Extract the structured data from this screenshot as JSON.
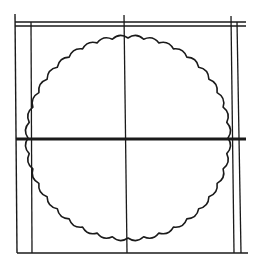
{
  "figure": {
    "width": 262,
    "height": 266,
    "background": "#ffffff",
    "stroke_color": "#1a1a1a",
    "lines": [
      {
        "id": "top-line-outer",
        "x1": 15,
        "y1": 22,
        "x2": 246,
        "y2": 22,
        "w": 1.4
      },
      {
        "id": "top-line-inner",
        "x1": 15,
        "y1": 26,
        "x2": 246,
        "y2": 26,
        "w": 1.4
      },
      {
        "id": "middle-line",
        "x1": 16,
        "y1": 139,
        "x2": 246,
        "y2": 139,
        "w": 2.8
      },
      {
        "id": "bottom-line",
        "x1": 17,
        "y1": 253,
        "x2": 248,
        "y2": 253,
        "w": 1.4
      },
      {
        "id": "left-outer-line",
        "x1": 15,
        "y1": 14,
        "x2": 17,
        "y2": 253,
        "w": 1.4
      },
      {
        "id": "left-inner-line",
        "x1": 31,
        "y1": 22,
        "x2": 32,
        "y2": 253,
        "w": 1.3
      },
      {
        "id": "center-vertical-line",
        "x1": 124,
        "y1": 15,
        "x2": 127,
        "y2": 253,
        "w": 1.3
      },
      {
        "id": "right-inner-line",
        "x1": 231,
        "y1": 16,
        "x2": 234,
        "y2": 253,
        "w": 1.3
      },
      {
        "id": "right-outer-line",
        "x1": 237,
        "y1": 22,
        "x2": 241,
        "y2": 253,
        "w": 1.3
      }
    ],
    "scalloped_circle": {
      "cx": 128,
      "cy": 138,
      "r": 100,
      "scallops": 40,
      "bump_depth": 3,
      "stroke_width": 1.6
    }
  }
}
